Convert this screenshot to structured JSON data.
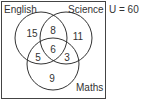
{
  "diagram": {
    "type": "venn",
    "universe_label": "U = 60",
    "sets": [
      {
        "name": "English",
        "label": "English"
      },
      {
        "name": "Science",
        "label": "Science"
      },
      {
        "name": "Maths",
        "label": "Maths"
      }
    ],
    "regions": {
      "english_only": "15",
      "science_only": "11",
      "maths_only": "9",
      "english_science": "8",
      "english_maths": "5",
      "science_maths": "3",
      "all_three": "6"
    },
    "colors": {
      "stroke": "#333333",
      "background": "#ffffff"
    }
  }
}
